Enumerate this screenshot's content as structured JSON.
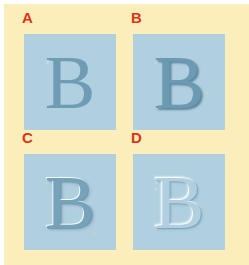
{
  "figure": {
    "background_color": "#fbeeba",
    "margin_color": "#ffffff",
    "swatch_color": "#b0cfdf",
    "label_color": "#e03317",
    "glyph_character": "B"
  },
  "panels": [
    {
      "label": "A",
      "glyph": "B",
      "effect_name": "flat-no-effect",
      "glyph_color": "#6f9cb4"
    },
    {
      "label": "B",
      "glyph": "B",
      "effect_name": "drop-shadow",
      "glyph_color": "#6b9ab3"
    },
    {
      "label": "C",
      "glyph": "B",
      "effect_name": "bevel-raised",
      "glyph_color": "#76a3ba"
    },
    {
      "label": "D",
      "glyph": "B",
      "effect_name": "engraved-emboss",
      "glyph_color": "#b0cfdf"
    }
  ]
}
